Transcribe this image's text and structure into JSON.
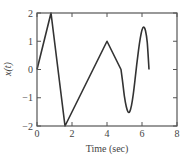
{
  "chart_data": {
    "type": "line",
    "title": "",
    "xlabel": "Time (sec)",
    "ylabel": "x(t)",
    "xlim": [
      0,
      8
    ],
    "ylim": [
      -2,
      2
    ],
    "grid": false,
    "legend": null,
    "xticks": [
      0,
      2,
      4,
      6,
      8
    ],
    "yticks": [
      -2,
      -1,
      0,
      1,
      2
    ],
    "xtick_labels": [
      "0",
      "2",
      "4",
      "6",
      "8"
    ],
    "ytick_labels": [
      "−2",
      "−1",
      "0",
      "1",
      "2"
    ],
    "series": [
      {
        "name": "x(t)",
        "color": "#333333",
        "x": [
          0,
          0.8,
          1.6,
          4.0,
          4.8,
          4.9,
          5.0,
          5.1,
          5.2,
          5.3,
          5.4,
          5.5,
          5.6,
          5.7,
          5.8,
          5.9,
          6.0,
          6.1,
          6.2,
          6.3,
          6.4
        ],
        "y": [
          0,
          2,
          -2,
          1,
          0,
          -0.47,
          -0.97,
          -1.31,
          -1.5,
          -1.49,
          -1.27,
          -0.88,
          -0.37,
          0.18,
          0.68,
          1.1,
          1.4,
          1.5,
          1.37,
          0.96,
          0
        ]
      }
    ]
  }
}
